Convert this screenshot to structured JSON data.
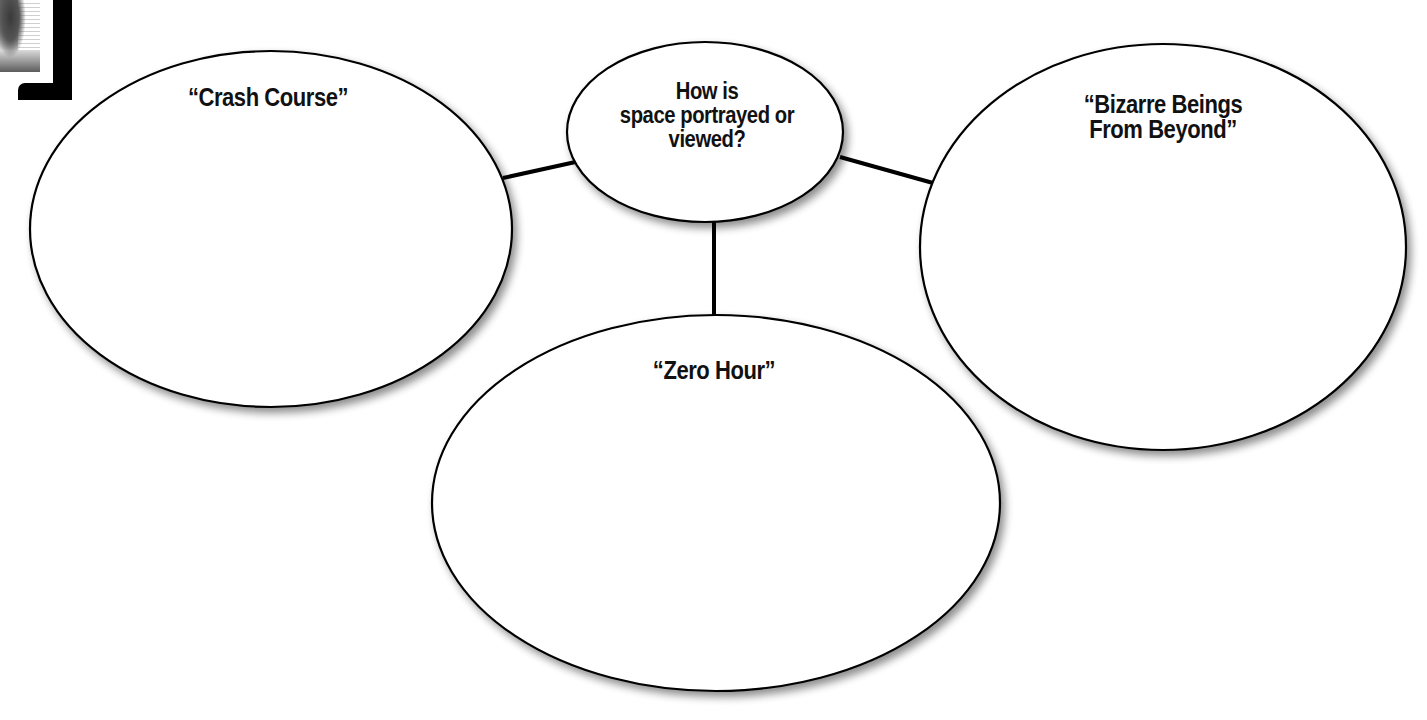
{
  "diagram": {
    "type": "web-organizer",
    "center": {
      "lines": [
        "How is",
        "space portrayed or",
        "viewed?"
      ]
    },
    "nodes": [
      {
        "id": "left",
        "title_lines": [
          "“Crash Course”"
        ]
      },
      {
        "id": "right",
        "title_lines": [
          "“Bizarre Beings",
          "From Beyond”"
        ]
      },
      {
        "id": "bottom",
        "title_lines": [
          "“Zero Hour”"
        ]
      }
    ],
    "edges": [
      {
        "from": "center",
        "to": "left"
      },
      {
        "from": "center",
        "to": "right"
      },
      {
        "from": "center",
        "to": "bottom"
      }
    ]
  },
  "colors": {
    "stroke": "#000000",
    "fill": "#ffffff",
    "text": "#111111"
  },
  "decorations": {
    "corner_thumbnail": "illustration-thumbnail",
    "corner_bracket": "black-corner-bracket"
  }
}
